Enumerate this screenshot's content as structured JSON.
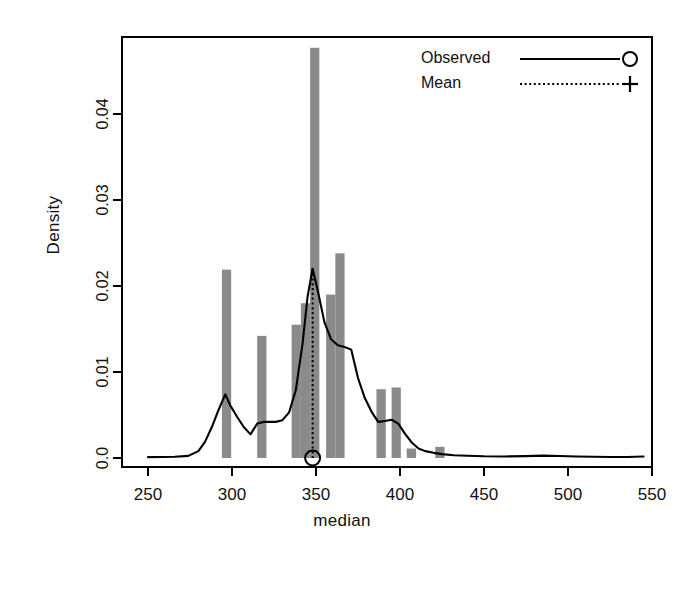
{
  "chart_data": {
    "type": "histogram",
    "title": "",
    "xlabel": "median",
    "ylabel": "Density",
    "xlim": [
      250,
      550
    ],
    "ylim": [
      0.0,
      0.048
    ],
    "grid": false,
    "xticks": [
      250,
      300,
      350,
      400,
      450,
      500,
      550
    ],
    "xtick_labels": [
      "250",
      "300",
      "350",
      "400",
      "450",
      "500",
      "550"
    ],
    "yticks": [
      0.0,
      0.01,
      0.02,
      0.03,
      0.04
    ],
    "ytick_labels": [
      "0.0",
      "0.01",
      "0.02",
      "0.03",
      "0.04"
    ],
    "legend": {
      "position": "top-right",
      "entries": [
        {
          "label": "Observed",
          "line_style": "solid",
          "marker": "circle",
          "marker_glyph": "○"
        },
        {
          "label": "Mean",
          "line_style": "dotted",
          "marker": "plus",
          "marker_glyph": "+"
        }
      ]
    },
    "bar_color": "#8a8a8a",
    "line_color": "#000000",
    "bars": [
      {
        "x0": 294.0,
        "x1": 299.5,
        "height": 0.0219
      },
      {
        "x0": 315.0,
        "x1": 320.5,
        "height": 0.0142
      },
      {
        "x0": 335.5,
        "x1": 341.0,
        "height": 0.0155
      },
      {
        "x0": 341.0,
        "x1": 346.5,
        "height": 0.018
      },
      {
        "x0": 346.5,
        "x1": 352.0,
        "height": 0.0477
      },
      {
        "x0": 356.0,
        "x1": 361.5,
        "height": 0.019
      },
      {
        "x0": 361.5,
        "x1": 367.0,
        "height": 0.0238
      },
      {
        "x0": 386.0,
        "x1": 391.5,
        "height": 0.008
      },
      {
        "x0": 395.0,
        "x1": 400.5,
        "height": 0.0082
      },
      {
        "x0": 404.0,
        "x1": 409.5,
        "height": 0.0011
      },
      {
        "x0": 421.0,
        "x1": 426.5,
        "height": 0.0013
      }
    ],
    "density_curve": {
      "name": "Observed",
      "x": [
        250,
        258,
        266,
        274,
        280,
        284,
        288,
        292,
        296,
        299,
        303,
        307,
        311,
        315,
        319,
        322,
        326,
        330,
        334,
        338,
        342,
        345,
        348,
        351,
        355,
        359,
        363,
        367,
        371,
        375,
        379,
        383,
        387,
        391,
        395,
        399,
        403,
        407,
        411,
        415,
        420,
        425,
        432,
        440,
        450,
        462,
        475,
        485,
        495,
        505,
        515,
        525,
        535,
        545
      ],
      "y": [
        0.0001,
        0.00012,
        0.00014,
        0.00025,
        0.0008,
        0.0019,
        0.0036,
        0.0056,
        0.0074,
        0.0061,
        0.0048,
        0.0036,
        0.00275,
        0.004,
        0.0042,
        0.0042,
        0.0042,
        0.0044,
        0.0053,
        0.0079,
        0.0133,
        0.0188,
        0.022,
        0.0195,
        0.0158,
        0.0138,
        0.0131,
        0.0129,
        0.0126,
        0.0093,
        0.007,
        0.0054,
        0.0042,
        0.0043,
        0.00445,
        0.004,
        0.0028,
        0.0018,
        0.0011,
        0.0008,
        0.0006,
        0.00045,
        0.00032,
        0.00026,
        0.0002,
        0.00018,
        0.00022,
        0.00028,
        0.00024,
        0.00018,
        0.00014,
        0.00012,
        0.00012,
        0.00018
      ]
    },
    "mean_line": {
      "name": "Mean",
      "x": 348.0,
      "y_top": 0.022,
      "y_bottom": 0.0,
      "line_style": "dotted",
      "marker": "circle",
      "marker_x": 348.0,
      "marker_y": 0.0
    }
  }
}
